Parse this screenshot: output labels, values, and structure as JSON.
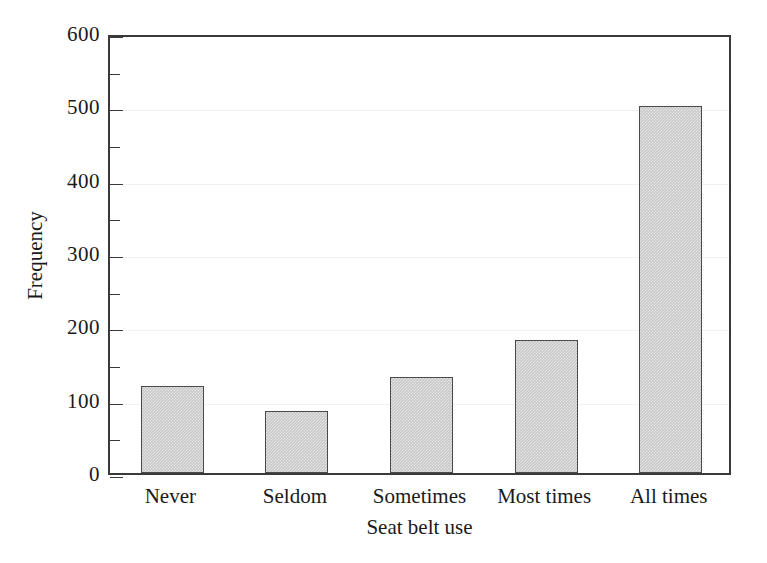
{
  "chart_data": {
    "type": "bar",
    "title": "",
    "xlabel": "Seat belt use",
    "ylabel": "Frequency",
    "categories": [
      "Never",
      "Seldom",
      "Sometimes",
      "Most times",
      "All times"
    ],
    "values": [
      118,
      85,
      131,
      181,
      500
    ],
    "ylim": [
      0,
      600
    ],
    "ytick_labels": [
      "0",
      "100",
      "200",
      "300",
      "400",
      "500",
      "600"
    ],
    "ytick_values": [
      0,
      100,
      200,
      300,
      400,
      500,
      600
    ],
    "yminor_tick_values": [
      50,
      150,
      250,
      350,
      450,
      550
    ],
    "ytick_interval": 100,
    "yminor_tick_interval": 50,
    "grid": true,
    "grid_axis": "y",
    "legend": false,
    "legend_position": "none",
    "bar_fill_color": "#c6c6c6",
    "bar_fill_pattern": "checkerboard-dither",
    "bar_border_color": "#4a4a4a",
    "axis_color": "#3a3a3a",
    "grid_color": "#f1f1f1",
    "background_color": "#ffffff",
    "text_color": "#1a1a1a"
  }
}
